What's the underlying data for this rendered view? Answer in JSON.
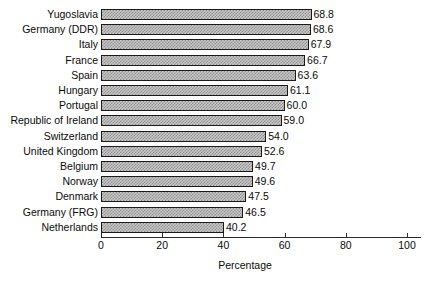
{
  "chart_data": {
    "type": "bar",
    "orientation": "horizontal",
    "title": "",
    "subtitle": "",
    "xlabel": "Percentage",
    "ylabel": "",
    "xlim": [
      0,
      100
    ],
    "xticks": [
      0,
      20,
      40,
      60,
      80,
      100
    ],
    "xtick_labels": [
      "0",
      "20",
      "40",
      "60",
      "80",
      "100"
    ],
    "grid": false,
    "legend": null,
    "show_value_labels": true,
    "categories": [
      "Yugoslavia",
      "Germany (DDR)",
      "Italy",
      "France",
      "Spain",
      "Hungary",
      "Portugal",
      "Republic of Ireland",
      "Switzerland",
      "United Kingdom",
      "Belgium",
      "Norway",
      "Denmark",
      "Germany (FRG)",
      "Netherlands"
    ],
    "values": [
      68.8,
      68.6,
      67.9,
      66.7,
      63.6,
      61.1,
      60.0,
      59.0,
      54.0,
      52.6,
      49.7,
      49.6,
      47.5,
      46.5,
      40.2
    ],
    "value_labels": [
      "68.8",
      "68.6",
      "67.9",
      "66.7",
      "63.6",
      "61.1",
      "60.0",
      "59.0",
      "54.0",
      "52.6",
      "49.7",
      "49.6",
      "47.5",
      "46.5",
      "40.2"
    ],
    "colors": {
      "bar_fill": "#c9c9c9",
      "bar_hatch": "#8e8e8e",
      "bar_edge": "#1a1a1a",
      "axis": "#2b2b2b",
      "text": "#0a0a0a",
      "background": "#ffffff"
    }
  }
}
